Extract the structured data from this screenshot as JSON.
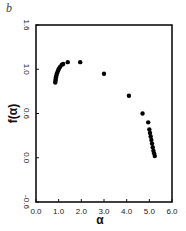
{
  "panel_label": "b",
  "chart_data": {
    "type": "scatter",
    "title": "",
    "xlabel": "α",
    "ylabel": "f(α)",
    "xlim": [
      0.0,
      6.0
    ],
    "ylim": [
      -0.5,
      1.5
    ],
    "x_ticks": [
      "0.0",
      "1.0",
      "2.0",
      "3.0",
      "4.0",
      "5.0",
      "6.0"
    ],
    "y_ticks": [
      "1.6",
      "1.0",
      "0.6",
      "0.0",
      "-0.6"
    ],
    "grid": false,
    "legend": null,
    "series": [
      {
        "name": "f(α) spectrum",
        "points": [
          [
            0.85,
            0.85
          ],
          [
            0.86,
            0.87
          ],
          [
            0.87,
            0.89
          ],
          [
            0.88,
            0.91
          ],
          [
            0.9,
            0.93
          ],
          [
            0.92,
            0.95
          ],
          [
            0.95,
            0.97
          ],
          [
            0.98,
            0.99
          ],
          [
            1.02,
            1.01
          ],
          [
            1.07,
            1.03
          ],
          [
            1.14,
            1.05
          ],
          [
            1.2,
            1.06
          ],
          [
            1.4,
            1.08
          ],
          [
            1.95,
            1.08
          ],
          [
            3.0,
            0.95
          ],
          [
            4.1,
            0.7
          ],
          [
            4.7,
            0.5
          ],
          [
            4.95,
            0.4
          ],
          [
            5.0,
            0.32
          ],
          [
            5.03,
            0.28
          ],
          [
            5.06,
            0.24
          ],
          [
            5.09,
            0.2
          ],
          [
            5.12,
            0.16
          ],
          [
            5.15,
            0.12
          ],
          [
            5.18,
            0.08
          ],
          [
            5.21,
            0.05
          ],
          [
            5.24,
            0.02
          ]
        ]
      }
    ]
  }
}
